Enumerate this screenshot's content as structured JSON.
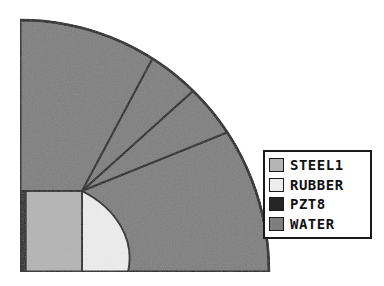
{
  "figure": {
    "background_color": "#ffffff",
    "outline_color": "#1a1a1a"
  },
  "geometry": {
    "center": {
      "x": 20,
      "y": 272
    },
    "outer_radius_x": 249,
    "outer_radius_y": 252,
    "corner_point": {
      "x": 82,
      "y": 191
    },
    "block_left_x": 20,
    "block_top_y": 191,
    "block_bottom_y": 272,
    "pzt_strip_width": 6,
    "steel_block_right_x": 82,
    "rubber_arc_radius_x": 108,
    "rubber_arc_radius_y": 81,
    "sector_angles_deg": [
      90,
      62,
      42,
      22,
      0
    ]
  },
  "materials": [
    {
      "key": "steel1",
      "label": "STEEL1",
      "color": "#b4b4b4"
    },
    {
      "key": "rubber",
      "label": "RUBBER",
      "color": "#ededed"
    },
    {
      "key": "pzt8",
      "label": "PZT8",
      "color": "#262626"
    },
    {
      "key": "water",
      "label": "WATER",
      "color": "#7e7e7e"
    }
  ],
  "legend": {
    "title": "",
    "border_color": "#1a1a1a",
    "background": "#ffffff",
    "items": [
      {
        "label": "STEEL1",
        "color": "#b4b4b4"
      },
      {
        "label": "RUBBER",
        "color": "#ededed"
      },
      {
        "label": "PZT8",
        "color": "#262626"
      },
      {
        "label": "WATER",
        "color": "#7e7e7e"
      }
    ]
  },
  "regions": [
    {
      "name": "water-sector-1",
      "material": "WATER",
      "color": "#7e7e7e"
    },
    {
      "name": "water-sector-2",
      "material": "WATER",
      "color": "#7e7e7e"
    },
    {
      "name": "water-sector-3",
      "material": "WATER",
      "color": "#7e7e7e"
    },
    {
      "name": "water-sector-4",
      "material": "WATER",
      "color": "#7e7e7e"
    },
    {
      "name": "steel-block",
      "material": "STEEL1",
      "color": "#b4b4b4"
    },
    {
      "name": "rubber-region",
      "material": "RUBBER",
      "color": "#ededed"
    },
    {
      "name": "pzt-strip",
      "material": "PZT8",
      "color": "#262626"
    }
  ]
}
